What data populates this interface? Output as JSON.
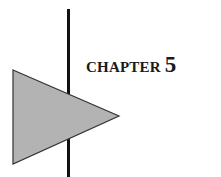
{
  "chapter": {
    "label": "CHAPTER",
    "number": "5"
  },
  "graphic": {
    "triangle_fill": "#b3b3b3",
    "triangle_stroke": "#333333",
    "line_color": "#111111"
  }
}
